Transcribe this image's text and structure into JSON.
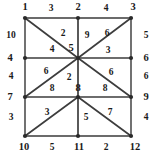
{
  "diagram": {
    "type": "graph",
    "colors": {
      "background": "#ffffff",
      "edge": "#3d3d3d",
      "frame_edge": "#6b6b6b",
      "node": "#2a2a2a",
      "text": "#1a1a1a"
    },
    "nodes": [
      {
        "id": "n1",
        "label": "1",
        "x": 25,
        "y": 18,
        "lx": 25,
        "ly": 7
      },
      {
        "id": "n2",
        "label": "2",
        "x": 78,
        "y": 18,
        "lx": 78,
        "ly": 7
      },
      {
        "id": "n3",
        "label": "3",
        "x": 131,
        "y": 18,
        "lx": 133,
        "ly": 7
      },
      {
        "id": "n4",
        "label": "4",
        "x": 25,
        "y": 58,
        "lx": 10,
        "ly": 58
      },
      {
        "id": "n5",
        "label": "5",
        "x": 78,
        "y": 58,
        "lx": 71,
        "ly": 48
      },
      {
        "id": "n6",
        "label": "6",
        "x": 131,
        "y": 58,
        "lx": 146,
        "ly": 58
      },
      {
        "id": "n7",
        "label": "7",
        "x": 25,
        "y": 97,
        "lx": 10,
        "ly": 97
      },
      {
        "id": "n8",
        "label": "8",
        "x": 78,
        "y": 97,
        "lx": 78,
        "ly": 88
      },
      {
        "id": "n9",
        "label": "9",
        "x": 131,
        "y": 97,
        "lx": 146,
        "ly": 97
      },
      {
        "id": "n10",
        "label": "10",
        "x": 25,
        "y": 136,
        "lx": 24,
        "ly": 147
      },
      {
        "id": "n11",
        "label": "11",
        "x": 78,
        "y": 136,
        "lx": 79,
        "ly": 147
      },
      {
        "id": "n12",
        "label": "12",
        "x": 131,
        "y": 136,
        "lx": 135,
        "ly": 147
      }
    ],
    "edges": [
      {
        "from": "n1",
        "to": "n2",
        "weight": "3",
        "wx": 51,
        "wy": 8,
        "frame": true
      },
      {
        "from": "n2",
        "to": "n3",
        "weight": "4",
        "wx": 106,
        "wy": 8,
        "frame": true
      },
      {
        "from": "n4",
        "to": "n5",
        "weight": "4",
        "wx": 52,
        "wy": 49,
        "frame": false
      },
      {
        "from": "n5",
        "to": "n6",
        "weight": "3",
        "wx": 108,
        "wy": 50,
        "frame": false
      },
      {
        "from": "n7",
        "to": "n8",
        "weight": "8",
        "wx": 52,
        "wy": 88,
        "frame": false
      },
      {
        "from": "n8",
        "to": "n9",
        "weight": "8",
        "wx": 105,
        "wy": 88,
        "frame": false
      },
      {
        "from": "n10",
        "to": "n11",
        "weight": "5",
        "wx": 52,
        "wy": 147,
        "frame": true
      },
      {
        "from": "n11",
        "to": "n12",
        "weight": "2",
        "wx": 106,
        "wy": 147,
        "frame": true
      },
      {
        "from": "n1",
        "to": "n4",
        "weight": "10",
        "wx": 11,
        "wy": 35,
        "frame": true
      },
      {
        "from": "n4",
        "to": "n7",
        "weight": "4",
        "wx": 11,
        "wy": 76,
        "frame": true
      },
      {
        "from": "n7",
        "to": "n10",
        "weight": "3",
        "wx": 11,
        "wy": 117,
        "frame": true
      },
      {
        "from": "n2",
        "to": "n5",
        "weight": "9",
        "wx": 87,
        "wy": 35,
        "frame": false
      },
      {
        "from": "n5",
        "to": "n8",
        "weight": "2",
        "wx": 69,
        "wy": 77,
        "frame": false
      },
      {
        "from": "n8",
        "to": "n11",
        "weight": "5",
        "wx": 86,
        "wy": 117,
        "frame": false
      },
      {
        "from": "n3",
        "to": "n6",
        "weight": "5",
        "wx": 146,
        "wy": 35,
        "frame": true
      },
      {
        "from": "n6",
        "to": "n9",
        "weight": "6",
        "wx": 146,
        "wy": 76,
        "frame": true
      },
      {
        "from": "n9",
        "to": "n12",
        "weight": "4",
        "wx": 146,
        "wy": 117,
        "frame": true
      },
      {
        "from": "n1",
        "to": "n5",
        "weight": "2",
        "wx": 63,
        "wy": 33,
        "frame": false
      },
      {
        "from": "n3",
        "to": "n5",
        "weight": "6",
        "wx": 107,
        "wy": 33,
        "frame": false
      },
      {
        "from": "n7",
        "to": "n5",
        "weight": "6",
        "wx": 46,
        "wy": 71,
        "frame": false
      },
      {
        "from": "n5",
        "to": "n9",
        "weight": "6",
        "wx": 111,
        "wy": 72,
        "frame": false
      },
      {
        "from": "n10",
        "to": "n8",
        "weight": "3",
        "wx": 47,
        "wy": 112,
        "frame": false
      },
      {
        "from": "n8",
        "to": "n12",
        "weight": "7",
        "wx": 110,
        "wy": 112,
        "frame": false
      }
    ]
  }
}
